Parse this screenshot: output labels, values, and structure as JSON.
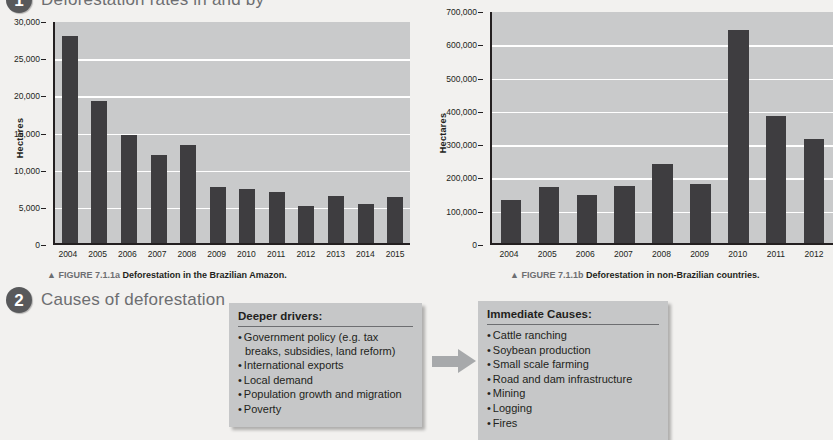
{
  "sections": [
    {
      "number": "1",
      "title": "Deforestation rates in and by"
    },
    {
      "number": "2",
      "title": "Causes of deforestation"
    }
  ],
  "captions": {
    "a": {
      "marker": "▲",
      "figno": "FIGURE 7.1.1a",
      "text": "Deforestation in the Brazilian Amazon."
    },
    "b": {
      "marker": "▲",
      "figno": "FIGURE 7.1.1b",
      "text": "Deforestation in non-Brazilian countries."
    }
  },
  "boxes": {
    "deeper": {
      "heading": "Deeper drivers:",
      "items": [
        "Government policy (e.g. tax breaks, subsidies, land reform)",
        "International exports",
        "Local demand",
        "Population growth and migration",
        "Poverty"
      ]
    },
    "immediate": {
      "heading": "Immediate Causes:",
      "items": [
        "Cattle ranching",
        "Soybean production",
        "Small scale farming",
        "Road and dam infrastructure",
        "Mining",
        "Logging",
        "Fires"
      ]
    },
    "arrow_name": "arrow-right-icon"
  },
  "colors": {
    "page_background": "#f2f1ef",
    "plot_background": "#c9cacb",
    "bar": "#3e3d40",
    "gridline": "#ffffff",
    "axis": "#231f20",
    "box_background": "#c6c7c8",
    "arrow": "#a7a9ab",
    "badge": "#58595b",
    "heading_text": "#6d6e71"
  },
  "chart_data": [
    {
      "type": "bar",
      "id": "brazilian-amazon",
      "title": "",
      "xlabel": "",
      "ylabel": "Hectares",
      "categories": [
        "2004",
        "2005",
        "2006",
        "2007",
        "2008",
        "2009",
        "2010",
        "2011",
        "2012",
        "2013",
        "2014",
        "2015"
      ],
      "values": [
        27800,
        19100,
        14500,
        11900,
        13200,
        7500,
        7200,
        6800,
        5000,
        6300,
        5300,
        6200
      ],
      "ylim": [
        0,
        30000
      ],
      "yticks": [
        0,
        5000,
        10000,
        15000,
        20000,
        25000,
        30000
      ],
      "ytick_labels": [
        "0",
        "5,000",
        "10,000",
        "15,000",
        "20,000",
        "25,000",
        "30,000"
      ],
      "grid": true,
      "legend": "none"
    },
    {
      "type": "bar",
      "id": "non-brazilian-countries",
      "title": "",
      "xlabel": "",
      "ylabel": "Hectares",
      "categories": [
        "2004",
        "2005",
        "2006",
        "2007",
        "2008",
        "2009",
        "2010",
        "2011",
        "2012"
      ],
      "values": [
        130000,
        168000,
        144000,
        172000,
        238000,
        176000,
        640000,
        382000,
        312000
      ],
      "ylim": [
        0,
        700000
      ],
      "yticks": [
        0,
        100000,
        200000,
        300000,
        400000,
        500000,
        600000,
        700000
      ],
      "ytick_labels": [
        "0",
        "100,000",
        "200,000",
        "300,000",
        "400,000",
        "500,000",
        "600,000",
        "700,000"
      ],
      "grid": true,
      "legend": "none"
    }
  ]
}
